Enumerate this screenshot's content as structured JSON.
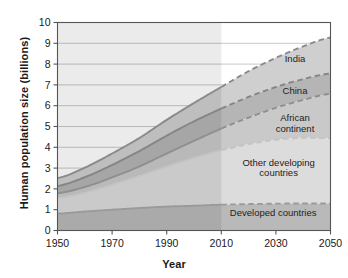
{
  "chart_data": {
    "type": "area",
    "title": "",
    "xlabel": "Year",
    "ylabel": "Human population size (billions)",
    "xlim": [
      1950,
      2050
    ],
    "ylim": [
      0,
      10
    ],
    "xticks": [
      1950,
      1970,
      1990,
      2010,
      2030,
      2050
    ],
    "yticks": [
      0,
      1,
      2,
      3,
      4,
      5,
      6,
      7,
      8,
      9,
      10
    ],
    "grid": true,
    "legend_position": "inline-right",
    "stacked": true,
    "projection_start": 2010,
    "annotations": [
      "Solid lines are historical data through 2010; dashed lines are projections to 2050."
    ],
    "x": [
      1950,
      1960,
      1970,
      1980,
      1990,
      2000,
      2010,
      2020,
      2030,
      2040,
      2050
    ],
    "series": [
      {
        "name": "Developed countries",
        "label": "Developed countries",
        "color": "#b9b9b9",
        "line_color": "#9a9a9a",
        "cumulative": [
          0.81,
          0.91,
          1.0,
          1.08,
          1.15,
          1.19,
          1.24,
          1.27,
          1.29,
          1.3,
          1.3
        ]
      },
      {
        "name": "Other developing countries",
        "label": "Other developing countries",
        "color": "#dcdcdc",
        "line_color": "#c4c4c4",
        "cumulative": [
          1.56,
          1.81,
          2.2,
          2.62,
          3.07,
          3.49,
          3.85,
          4.15,
          4.36,
          4.46,
          4.43
        ]
      },
      {
        "name": "African continent",
        "label": "African continent",
        "color": "#c9c9c9",
        "line_color": "#8f8f8f",
        "cumulative": [
          1.79,
          2.09,
          2.55,
          3.08,
          3.7,
          4.31,
          4.9,
          5.43,
          5.9,
          6.28,
          6.58
        ]
      },
      {
        "name": "China",
        "label": "China",
        "color": "#b5b5b5",
        "line_color": "#858585",
        "cumulative": [
          2.14,
          2.56,
          3.15,
          3.82,
          4.56,
          5.25,
          5.86,
          6.42,
          6.9,
          7.28,
          7.55
        ]
      },
      {
        "name": "India",
        "label": "India",
        "color": "#cfcfcf",
        "line_color": "#8a8a8a",
        "cumulative": [
          2.52,
          3.02,
          3.7,
          4.45,
          5.32,
          6.13,
          6.9,
          7.66,
          8.3,
          8.85,
          9.28
        ]
      }
    ],
    "series_labels": [
      {
        "text": "India",
        "x": 2037,
        "y": 8.1
      },
      {
        "text": "China",
        "x": 2037,
        "y": 6.55
      },
      {
        "text": "African",
        "x": 2037,
        "y": 5.25
      },
      {
        "text": "continent",
        "x": 2037,
        "y": 4.75
      },
      {
        "text": "Other developing",
        "x": 2031,
        "y": 3.1
      },
      {
        "text": "countries",
        "x": 2031,
        "y": 2.6
      },
      {
        "text": "Developed countries",
        "x": 2029,
        "y": 0.72
      }
    ],
    "colors": {
      "axis": "#555555",
      "grid": "#c8c8c8",
      "text": "#1a1a1a",
      "plot_background": "#ffffff",
      "history_overlay": "#00000014"
    }
  }
}
